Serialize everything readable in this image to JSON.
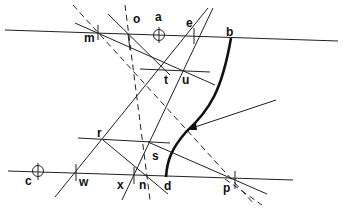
{
  "diagram": {
    "title": "",
    "labels": {
      "m": "m",
      "o": "o",
      "a": "a",
      "e": "e",
      "b": "b",
      "t": "t",
      "u": "u",
      "r": "r",
      "s": "s",
      "c": "c",
      "w": "w",
      "x": "x",
      "n": "n",
      "d": "d",
      "p": "p"
    },
    "nodes": [
      {
        "id": "m",
        "x": 98,
        "y": 33
      },
      {
        "id": "o",
        "x": 128,
        "y": 33
      },
      {
        "id": "a",
        "x": 158,
        "y": 34
      },
      {
        "id": "e",
        "x": 195,
        "y": 36
      },
      {
        "id": "b",
        "x": 231,
        "y": 38
      },
      {
        "id": "t",
        "x": 165,
        "y": 70
      },
      {
        "id": "u",
        "x": 178,
        "y": 71
      },
      {
        "id": "r",
        "x": 103,
        "y": 140
      },
      {
        "id": "s",
        "x": 148,
        "y": 142
      },
      {
        "id": "c",
        "x": 38,
        "y": 172
      },
      {
        "id": "w",
        "x": 75,
        "y": 173
      },
      {
        "id": "x",
        "x": 133,
        "y": 175
      },
      {
        "id": "n",
        "x": 146,
        "y": 176
      },
      {
        "id": "d",
        "x": 167,
        "y": 177
      },
      {
        "id": "p",
        "x": 235,
        "y": 180
      }
    ],
    "arrow": {
      "from": [
        276,
        100
      ],
      "to": [
        188,
        129
      ]
    }
  }
}
